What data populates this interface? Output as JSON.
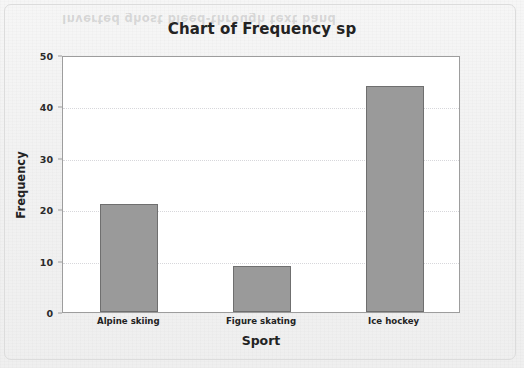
{
  "chart_data": {
    "type": "bar",
    "title": "Chart of Frequency sp",
    "xlabel": "Sport",
    "ylabel": "Frequency",
    "categories": [
      "Alpine skiing",
      "Figure skating",
      "Ice hockey"
    ],
    "values": [
      21,
      9,
      44
    ],
    "ylim": [
      0,
      50
    ],
    "y_ticks": [
      0,
      10,
      20,
      30,
      40,
      50
    ],
    "y_tick_labels": [
      "0",
      "10",
      "20",
      "30",
      "40",
      "50"
    ],
    "grid": true,
    "legend": null,
    "bar_color": "#9a9a9a",
    "bar_border_color": "#6f6f6f",
    "plot_background": "#ffffff",
    "page_background": "#f2f2f2"
  },
  "artifacts": {
    "ghost_text": "Inverted ghost bleed-through text band"
  }
}
